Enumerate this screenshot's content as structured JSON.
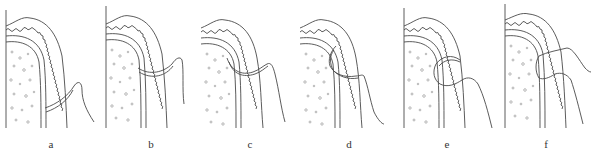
{
  "figure": {
    "type": "suture technique sequence",
    "line_color": "#4a4a4a",
    "dot_color": "#8a8a8a",
    "panels": [
      {
        "id": "a",
        "label": "a",
        "x": 2
      },
      {
        "id": "b",
        "label": "b",
        "x": 102
      },
      {
        "id": "c",
        "label": "c",
        "x": 201
      },
      {
        "id": "d",
        "label": "d",
        "x": 300
      },
      {
        "id": "e",
        "label": "e",
        "x": 398
      },
      {
        "id": "f",
        "label": "f",
        "x": 497
      }
    ]
  }
}
